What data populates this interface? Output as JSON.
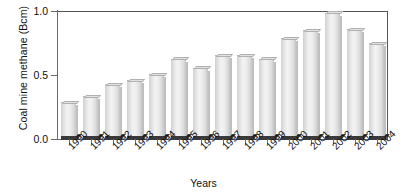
{
  "chart_data": {
    "type": "bar",
    "title": "",
    "xlabel": "Years",
    "ylabel": "Coal mine methane (Bcm)",
    "categories": [
      "1990",
      "1991",
      "1992",
      "1993",
      "1994",
      "1995",
      "1996",
      "1997",
      "1998",
      "1999",
      "2000",
      "2001",
      "2002",
      "2003",
      "2004"
    ],
    "values": [
      0.28,
      0.33,
      0.42,
      0.45,
      0.5,
      0.62,
      0.55,
      0.65,
      0.65,
      0.62,
      0.78,
      0.84,
      0.98,
      0.85,
      0.74
    ],
    "ylim": [
      0.0,
      1.0
    ],
    "yticks": [
      0.0,
      0.5,
      1.0
    ],
    "ytick_labels": [
      "0.0",
      "0.5",
      "1.0"
    ],
    "grid": false,
    "legend": null,
    "bar_color": "#ededed",
    "bar_edge_color": "#b4b4b4",
    "axis_color": "#6a6a6a"
  },
  "axis": {
    "y_title": "Coal mine methane (Bcm)",
    "x_title": "Years"
  }
}
